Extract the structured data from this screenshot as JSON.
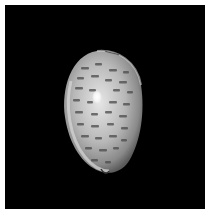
{
  "image": {
    "subject": "cowrie shell",
    "description": "Dorsal view of a spotted cowrie shell photographed on a black background",
    "background_color": "#000000",
    "border_color": "#ffffff",
    "shell_colors": {
      "base": "#bdbdbd",
      "rim": "#d9d9d9",
      "spots": "#4a4a4a",
      "highlight": "#ffffff"
    }
  }
}
